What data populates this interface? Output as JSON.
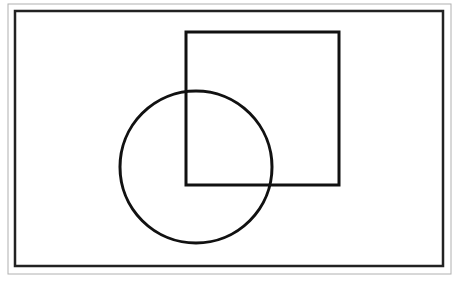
{
  "diagram": {
    "type": "geometric-shapes",
    "background": "#ffffff",
    "outer_frame": {
      "x": 8,
      "y": 4,
      "width": 443,
      "height": 270,
      "stroke": "#b0b0b0",
      "stroke_width": 1
    },
    "inner_frame": {
      "x": 15,
      "y": 11,
      "width": 428,
      "height": 255,
      "stroke": "#222222",
      "stroke_width": 2.5
    },
    "square": {
      "x": 186,
      "y": 32,
      "width": 153,
      "height": 153,
      "stroke": "#111111",
      "stroke_width": 3
    },
    "circle": {
      "cx": 196,
      "cy": 167,
      "r": 76,
      "stroke": "#111111",
      "stroke_width": 3
    }
  }
}
